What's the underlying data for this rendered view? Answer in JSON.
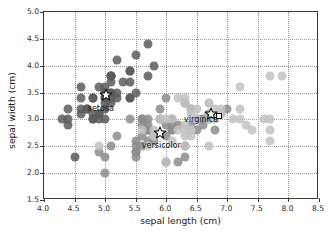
{
  "figure": {
    "title": "",
    "background": "#ffffff",
    "axes_edge_color": "#3a3a3a",
    "grid_color": "#9b9b9b"
  },
  "chart_data": {
    "type": "scatter",
    "title": "",
    "xlabel": "sepal length (cm)",
    "ylabel": "sepal width (cm)",
    "xlim": [
      4.0,
      8.5
    ],
    "ylim": [
      1.5,
      5.0
    ],
    "xticks": [
      "4.0",
      "4.5",
      "5.0",
      "5.5",
      "6.0",
      "6.5",
      "7.0",
      "7.5",
      "8.0",
      "8.5"
    ],
    "yticks": [
      "1.5",
      "2.0",
      "2.5",
      "3.0",
      "3.5",
      "4.0",
      "4.5",
      "5.0"
    ],
    "xtick_values": [
      4.0,
      4.5,
      5.0,
      5.5,
      6.0,
      6.5,
      7.0,
      7.5,
      8.0,
      8.5
    ],
    "ytick_values": [
      1.5,
      2.0,
      2.5,
      3.0,
      3.5,
      4.0,
      4.5,
      5.0
    ],
    "grid": true,
    "grid_style": "dotted",
    "legend": "none",
    "legend_position": "none",
    "annotations": [
      {
        "text": "setosa",
        "x": 4.93,
        "y": 3.22,
        "color": "#111111"
      },
      {
        "text": "versicolor",
        "x": 5.92,
        "y": 2.52,
        "color": "#111111"
      },
      {
        "text": "virginica",
        "x": 6.57,
        "y": 3.0,
        "color": "#111111"
      }
    ],
    "centroids": [
      {
        "name": "setosa",
        "marker": "star",
        "x": 5.01,
        "y": 3.46,
        "facecolor": "#ffffff",
        "edgecolor": "#111111",
        "size": 13
      },
      {
        "name": "versicolor",
        "marker": "star",
        "x": 5.9,
        "y": 2.74,
        "facecolor": "#ffffff",
        "edgecolor": "#111111",
        "size": 13
      },
      {
        "name": "virginica",
        "marker": "star",
        "x": 6.74,
        "y": 3.1,
        "facecolor": "#ffffff",
        "edgecolor": "#111111",
        "size": 13
      }
    ],
    "extra_markers": [
      {
        "name": "square-marker",
        "marker": "square",
        "x": 6.86,
        "y": 3.06,
        "facecolor": "#ffffff",
        "edgecolor": "#111111",
        "size": 6
      }
    ],
    "series": [
      {
        "name": "setosa",
        "color": "#5c5c5c",
        "marker": "o",
        "alpha": 0.85,
        "size": 9,
        "points": [
          [
            5.1,
            3.5
          ],
          [
            4.9,
            3.0
          ],
          [
            4.7,
            3.2
          ],
          [
            4.6,
            3.1
          ],
          [
            5.0,
            3.6
          ],
          [
            5.4,
            3.9
          ],
          [
            4.6,
            3.4
          ],
          [
            5.0,
            3.4
          ],
          [
            4.4,
            2.9
          ],
          [
            4.9,
            3.1
          ],
          [
            5.4,
            3.7
          ],
          [
            4.8,
            3.4
          ],
          [
            4.8,
            3.0
          ],
          [
            4.3,
            3.0
          ],
          [
            5.8,
            4.0
          ],
          [
            5.7,
            4.4
          ],
          [
            5.4,
            3.9
          ],
          [
            5.1,
            3.5
          ],
          [
            5.7,
            3.8
          ],
          [
            5.1,
            3.8
          ],
          [
            5.4,
            3.4
          ],
          [
            5.1,
            3.7
          ],
          [
            4.6,
            3.6
          ],
          [
            5.1,
            3.3
          ],
          [
            4.8,
            3.4
          ],
          [
            5.0,
            3.0
          ],
          [
            5.0,
            3.4
          ],
          [
            5.2,
            3.5
          ],
          [
            5.2,
            3.4
          ],
          [
            4.7,
            3.2
          ],
          [
            4.8,
            3.1
          ],
          [
            5.4,
            3.4
          ],
          [
            5.2,
            4.1
          ],
          [
            5.5,
            4.2
          ],
          [
            4.9,
            3.1
          ],
          [
            5.0,
            3.2
          ],
          [
            5.5,
            3.5
          ],
          [
            4.9,
            3.6
          ],
          [
            4.4,
            3.0
          ],
          [
            5.1,
            3.4
          ],
          [
            5.0,
            3.5
          ],
          [
            4.5,
            2.3
          ],
          [
            4.4,
            3.2
          ],
          [
            5.0,
            3.5
          ],
          [
            5.1,
            3.8
          ],
          [
            4.8,
            3.0
          ],
          [
            5.1,
            3.8
          ],
          [
            4.6,
            3.2
          ],
          [
            5.3,
            3.7
          ],
          [
            5.0,
            3.3
          ]
        ]
      },
      {
        "name": "versicolor",
        "color": "#8c8c8c",
        "marker": "o",
        "alpha": 0.85,
        "size": 9,
        "points": [
          [
            7.0,
            3.2
          ],
          [
            6.4,
            3.2
          ],
          [
            6.9,
            3.1
          ],
          [
            5.5,
            2.3
          ],
          [
            6.5,
            2.8
          ],
          [
            5.7,
            2.8
          ],
          [
            6.3,
            3.3
          ],
          [
            4.9,
            2.4
          ],
          [
            6.6,
            2.9
          ],
          [
            5.2,
            2.7
          ],
          [
            5.0,
            2.0
          ],
          [
            5.9,
            3.0
          ],
          [
            6.0,
            2.2
          ],
          [
            6.1,
            2.9
          ],
          [
            5.6,
            2.9
          ],
          [
            6.7,
            3.1
          ],
          [
            5.6,
            3.0
          ],
          [
            5.8,
            2.7
          ],
          [
            6.2,
            2.2
          ],
          [
            5.6,
            2.5
          ],
          [
            5.9,
            3.2
          ],
          [
            6.1,
            2.8
          ],
          [
            6.3,
            2.5
          ],
          [
            6.1,
            2.8
          ],
          [
            6.4,
            2.9
          ],
          [
            6.6,
            3.0
          ],
          [
            6.8,
            2.8
          ],
          [
            6.7,
            3.0
          ],
          [
            6.0,
            2.9
          ],
          [
            5.7,
            2.6
          ],
          [
            5.5,
            2.4
          ],
          [
            5.5,
            2.4
          ],
          [
            5.8,
            2.7
          ],
          [
            6.0,
            2.7
          ],
          [
            5.4,
            3.0
          ],
          [
            6.0,
            3.4
          ],
          [
            6.7,
            3.1
          ],
          [
            6.3,
            2.3
          ],
          [
            5.6,
            3.0
          ],
          [
            5.5,
            2.5
          ],
          [
            5.5,
            2.6
          ],
          [
            6.1,
            3.0
          ],
          [
            5.8,
            2.6
          ],
          [
            5.0,
            2.3
          ],
          [
            5.6,
            2.7
          ],
          [
            5.7,
            3.0
          ],
          [
            5.7,
            2.9
          ],
          [
            6.2,
            2.9
          ],
          [
            5.1,
            2.5
          ],
          [
            5.7,
            2.8
          ]
        ]
      },
      {
        "name": "virginica",
        "color": "#c2c2c2",
        "marker": "o",
        "alpha": 0.85,
        "size": 9,
        "points": [
          [
            6.3,
            3.3
          ],
          [
            5.8,
            2.7
          ],
          [
            7.1,
            3.0
          ],
          [
            6.3,
            2.9
          ],
          [
            6.5,
            3.0
          ],
          [
            7.6,
            3.0
          ],
          [
            4.9,
            2.5
          ],
          [
            7.3,
            2.9
          ],
          [
            6.7,
            2.5
          ],
          [
            7.2,
            3.6
          ],
          [
            6.5,
            3.2
          ],
          [
            6.4,
            2.7
          ],
          [
            6.8,
            3.0
          ],
          [
            5.7,
            2.5
          ],
          [
            5.8,
            2.8
          ],
          [
            6.4,
            3.2
          ],
          [
            6.5,
            3.0
          ],
          [
            7.7,
            3.8
          ],
          [
            7.7,
            2.6
          ],
          [
            6.0,
            2.2
          ],
          [
            6.9,
            3.2
          ],
          [
            5.6,
            2.8
          ],
          [
            7.7,
            2.8
          ],
          [
            6.3,
            2.7
          ],
          [
            6.7,
            3.3
          ],
          [
            7.2,
            3.2
          ],
          [
            6.2,
            2.8
          ],
          [
            6.1,
            3.0
          ],
          [
            6.4,
            2.8
          ],
          [
            7.2,
            3.0
          ],
          [
            7.4,
            2.8
          ],
          [
            7.9,
            3.8
          ],
          [
            6.4,
            2.8
          ],
          [
            6.3,
            2.8
          ],
          [
            6.1,
            2.6
          ],
          [
            7.7,
            3.0
          ],
          [
            6.3,
            3.4
          ],
          [
            6.4,
            3.1
          ],
          [
            6.0,
            3.0
          ],
          [
            6.9,
            3.1
          ],
          [
            6.7,
            3.1
          ],
          [
            6.9,
            3.1
          ],
          [
            5.8,
            2.7
          ],
          [
            6.8,
            3.2
          ],
          [
            6.7,
            3.3
          ],
          [
            6.7,
            3.0
          ],
          [
            6.3,
            2.5
          ],
          [
            6.5,
            3.0
          ],
          [
            6.2,
            3.4
          ],
          [
            5.9,
            3.0
          ]
        ]
      }
    ]
  }
}
